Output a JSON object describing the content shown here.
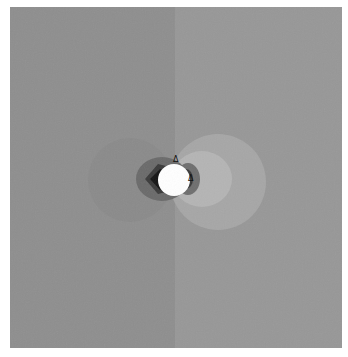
{
  "figure": {
    "colors": {
      "left_background": "#8e8e8e",
      "right_background": "#979797",
      "left_lobe": "#8a8a8a",
      "right_outer_lobe": "#a6a6a6",
      "right_inner_lobe": "#b4b4b4",
      "dark_ring": "#5a5a5a",
      "darker_ring": "#2e2e2e",
      "darkest_core": "#141414",
      "disc": "#ffffff"
    },
    "markers": {
      "top": "Δ",
      "right": "Δ"
    }
  }
}
